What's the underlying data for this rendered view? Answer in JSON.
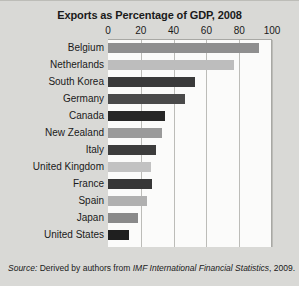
{
  "chart_data": {
    "type": "bar",
    "orientation": "horizontal",
    "title": "Exports as Percentage of GDP, 2008",
    "xlabel": "",
    "ylabel": "",
    "xlim": [
      0,
      100
    ],
    "xticks": [
      0,
      20,
      40,
      60,
      80,
      100
    ],
    "xtick_labels": [
      "0",
      "20",
      "40",
      "60",
      "80",
      "100"
    ],
    "grid": true,
    "legend": "none",
    "categories": [
      "Belgium",
      "Netherlands",
      "South Korea",
      "Germany",
      "Canada",
      "New Zealand",
      "Italy",
      "United Kingdom",
      "France",
      "Spain",
      "Japan",
      "United States"
    ],
    "values": [
      92,
      77,
      53,
      47,
      35,
      33,
      29,
      26,
      27,
      24,
      18,
      13
    ],
    "bar_colors": [
      "#8f8f8f",
      "#bdbdbd",
      "#3a3a3a",
      "#4a4a4a",
      "#262626",
      "#9a9a9a",
      "#3d3d3d",
      "#c2c2c2",
      "#373737",
      "#b0b0b0",
      "#8a8a8a",
      "#1f1f1f"
    ]
  },
  "source": {
    "lead": "Source:",
    "text_before": " Derived by authors from ",
    "publication": "IMF International Financial Statistics",
    "text_after": ", 2009."
  },
  "colors": {
    "figure_background": "#d9d9d6",
    "plot_background": "#fbfbfa",
    "gridline": "#bcbcb8",
    "axis_line": "#a8a8a4",
    "text": "#1a1a1a"
  }
}
